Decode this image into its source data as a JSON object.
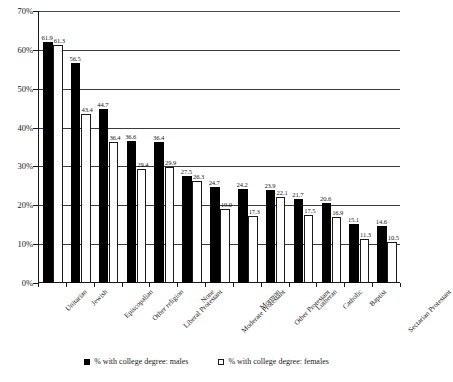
{
  "chart_data": {
    "type": "bar",
    "title": "",
    "subtitle": "",
    "xlabel": "",
    "ylabel": "",
    "ylim": [
      0,
      70
    ],
    "ytick_labels": [
      "0%",
      "10%",
      "20%",
      "30%",
      "40%",
      "50%",
      "60%",
      "70%"
    ],
    "ytick_values": [
      0,
      10,
      20,
      30,
      40,
      50,
      60,
      70
    ],
    "grid": true,
    "grid_axis": "y",
    "legend_position": "bottom",
    "categories": [
      "Unitarian",
      "Jewish",
      "Episcopalian",
      "Other religion",
      "Liberal Protestant",
      "None",
      "Moderate Protestant",
      "Mormon",
      "Other Protestant",
      "Lutheran",
      "Catholic",
      "Baptist",
      "Sectarian Protestant"
    ],
    "series": [
      {
        "name": "% with college degree: males",
        "color": "#000000",
        "values": [
          61.9,
          56.5,
          44.7,
          36.6,
          36.4,
          27.5,
          24.7,
          24.2,
          23.9,
          21.7,
          20.6,
          15.1,
          14.6
        ]
      },
      {
        "name": "% with college degree: females",
        "color": "#ffffff",
        "values": [
          61.3,
          43.4,
          36.4,
          29.4,
          29.9,
          26.3,
          19.0,
          17.3,
          22.1,
          17.5,
          16.9,
          11.3,
          10.5
        ]
      }
    ],
    "data_labels": {
      "males": [
        "61.9",
        "56.5",
        "44.7",
        "36.6",
        "36.4",
        "27.5",
        "24.7",
        "24.2",
        "23.9",
        "21.7",
        "20.6",
        "15.1",
        "14.6"
      ],
      "females": [
        "61.3",
        "43.4",
        "36.4",
        "29.4",
        "29.9",
        "26.3",
        "19.0",
        "17.3",
        "22.1",
        "17.5",
        "16.9",
        "11.3",
        "10.5"
      ]
    }
  },
  "legend": {
    "items": [
      {
        "label": "% with college degree: males",
        "marker": "filled-square-marker"
      },
      {
        "label": "% with college degree: females",
        "marker": "hollow-square-marker"
      }
    ]
  },
  "colors": {
    "male_bar": "#000000",
    "female_bar": "#ffffff",
    "bar_outline": "#1a1a1a",
    "gridline": "#3a3a3a",
    "axis": "#1a1a1a",
    "background": "#ffffff",
    "text": "#1a1a1a"
  }
}
